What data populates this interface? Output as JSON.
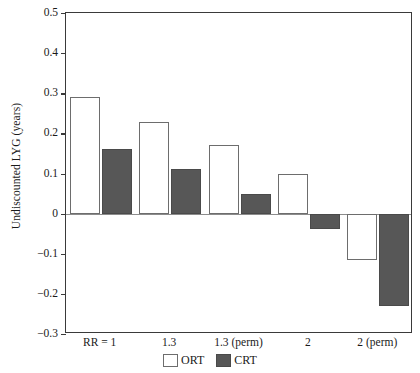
{
  "chart_data": {
    "type": "bar",
    "title": "",
    "xlabel": "",
    "ylabel": "Undiscounted LYG (years)",
    "categories": [
      "RR = 1",
      "1.3",
      "1.3 (perm)",
      "2",
      "2 (perm)"
    ],
    "series": [
      {
        "name": "ORT",
        "color": "#ffffff",
        "values": [
          0.29,
          0.2275,
          0.17,
          0.1,
          -0.115
        ]
      },
      {
        "name": "CRT",
        "color": "#575757",
        "values": [
          0.16,
          0.11,
          0.05,
          -0.0375,
          -0.23
        ]
      }
    ],
    "ylim": [
      -0.3,
      0.5
    ],
    "yticks": [
      0.5,
      0.4,
      0.3,
      0.2,
      0.1,
      0,
      -0.1,
      -0.2,
      -0.3
    ],
    "ytick_labels": [
      "0.5",
      "0.4",
      "0.3",
      "0.2",
      "0.1",
      "0",
      "−0.1",
      "−0.2",
      "−0.3"
    ],
    "grid": false,
    "legend_position": "bottom",
    "legend": [
      "ORT",
      "CRT"
    ],
    "zero_line": 0
  },
  "axis": {
    "y_title": "Undiscounted LYG (years)"
  },
  "legend": {
    "items": [
      {
        "label": "ORT",
        "swatch": "white-square-icon"
      },
      {
        "label": "CRT",
        "swatch": "dark-square-icon"
      }
    ]
  }
}
